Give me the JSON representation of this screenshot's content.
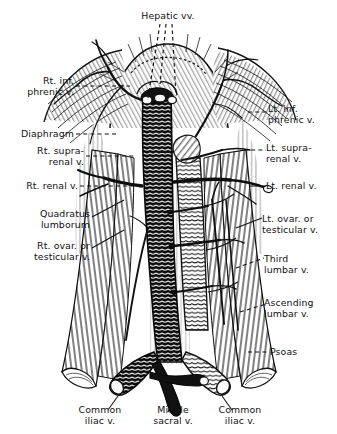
{
  "figure": {
    "style": "black-and-white line engraving",
    "ink_color": "#111111",
    "paper_color": "#ffffff"
  },
  "labels": {
    "hepatic": "Hepatic vv.",
    "rt_inf_phrenic": "Rt. inf.\nphrenic v.",
    "diaphragm": "Diaphragm",
    "rt_suprarenal": "Rt. supra-\nrenal v.",
    "rt_renal": "Rt. renal v.",
    "quadratus": "Quadratus\nlumborum",
    "rt_ovarian": "Rt. ovar. or\ntesticular v.",
    "lt_inf_phrenic": "Lt. inf.\nphrenic v.",
    "lt_suprarenal": "Lt. supra-\nrenal v.",
    "lt_renal": "Lt. renal v.",
    "lt_ovarian": "Lt. ovar. or\ntesticular v.",
    "third_lumbar": "Third\nlumbar v.",
    "ascending_lumbar": "Ascending\nlumbar v.",
    "psoas": "Psoas",
    "common_iliac_left": "Common\niliac v.",
    "middle_sacral": "Middle\nsacral v.",
    "common_iliac_right": "Common\niliac v."
  }
}
